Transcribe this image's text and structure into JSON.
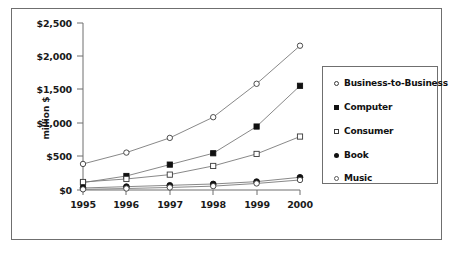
{
  "chart_data": {
    "type": "line",
    "title": "",
    "subtitle": "",
    "xlabel": "",
    "ylabel": "million $",
    "categories": [
      "1995",
      "1996",
      "1997",
      "1998",
      "1999",
      "2000"
    ],
    "x": [
      1995,
      1996,
      1997,
      1998,
      1999,
      2000
    ],
    "ylim": [
      0,
      2500
    ],
    "ytick_values": [
      0,
      500,
      1000,
      1500,
      2000,
      2500
    ],
    "ytick_labels": [
      "$0",
      "$500",
      "$1,000",
      "$1,500",
      "$2,000",
      "$2,500"
    ],
    "grid": false,
    "legend_position": "right",
    "series": [
      {
        "name": "Business-to-Business",
        "marker": "open-circle",
        "values": [
          390,
          560,
          780,
          1090,
          1590,
          2160
        ]
      },
      {
        "name": "Computer",
        "marker": "filled-square",
        "values": [
          110,
          210,
          380,
          550,
          950,
          1560
        ]
      },
      {
        "name": "Consumer",
        "marker": "open-square",
        "values": [
          120,
          165,
          230,
          360,
          540,
          800
        ]
      },
      {
        "name": "Book",
        "marker": "filled-circle",
        "values": [
          30,
          50,
          70,
          90,
          125,
          190
        ]
      },
      {
        "name": "Music",
        "marker": "open-diamond",
        "values": [
          10,
          22,
          38,
          58,
          98,
          150
        ]
      }
    ]
  },
  "axis": {
    "y_title": "million $",
    "y_labels": [
      "$2,500",
      "$2,000",
      "$1,500",
      "$1,000",
      "$500",
      "$0"
    ],
    "x_labels": [
      "1995",
      "1996",
      "1997",
      "1998",
      "1999",
      "2000"
    ]
  },
  "legend": {
    "items": [
      {
        "label": "Business-to-Business",
        "marker": "open-circle"
      },
      {
        "label": "Computer",
        "marker": "filled-square"
      },
      {
        "label": "Consumer",
        "marker": "open-square"
      },
      {
        "label": "Book",
        "marker": "filled-circle"
      },
      {
        "label": "Music",
        "marker": "open-diamond"
      }
    ]
  },
  "colors": {
    "line": "#7a7a7a",
    "marker_stroke": "#3a3a3a",
    "marker_fill_dark": "#111111",
    "axis": "#6f6f6f",
    "text": "#1a1a1a",
    "frame": "#6f6f6f"
  },
  "caption": {
    "text": ""
  }
}
